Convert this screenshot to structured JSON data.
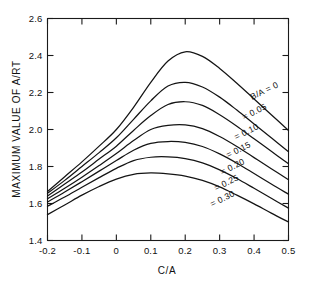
{
  "chart_data": {
    "type": "line",
    "title": "",
    "xlabel": "C/A",
    "ylabel": "MAXIMUM VALUE OF A/RT",
    "xlim": [
      -0.2,
      0.5
    ],
    "ylim": [
      1.4,
      2.6
    ],
    "xticks": [
      "-0.2",
      "-0.1",
      "0",
      "0.1",
      "0.2",
      "0.3",
      "0.4",
      "0.5"
    ],
    "xtick_values": [
      -0.2,
      -0.1,
      0,
      0.1,
      0.2,
      0.3,
      0.4,
      0.5
    ],
    "yticks": [
      "1.4",
      "1.6",
      "1.8",
      "2.0",
      "2.2",
      "2.4",
      "2.6"
    ],
    "ytick_values": [
      1.4,
      1.6,
      1.8,
      2.0,
      2.2,
      2.4,
      2.6
    ],
    "grid": false,
    "legend_position": "inline-right",
    "legend_prefix": "B/A =",
    "x": [
      -0.2,
      -0.15,
      -0.1,
      -0.05,
      0.0,
      0.05,
      0.1,
      0.15,
      0.2,
      0.25,
      0.3,
      0.35,
      0.4,
      0.45,
      0.5
    ],
    "series": [
      {
        "name": "B/A = 0",
        "label": "B/A = 0",
        "values": [
          1.665,
          1.745,
          1.825,
          1.91,
          2.0,
          2.12,
          2.255,
          2.37,
          2.42,
          2.395,
          2.33,
          2.25,
          2.165,
          2.08,
          1.995
        ]
      },
      {
        "name": "B/A = 0.05",
        "label": "= 0.05",
        "values": [
          1.655,
          1.725,
          1.8,
          1.875,
          1.955,
          2.055,
          2.155,
          2.235,
          2.255,
          2.23,
          2.175,
          2.105,
          2.03,
          1.955,
          1.88
        ]
      },
      {
        "name": "B/A = 0.10",
        "label": "= 0.10",
        "values": [
          1.64,
          1.705,
          1.77,
          1.84,
          1.91,
          1.995,
          2.075,
          2.135,
          2.15,
          2.13,
          2.08,
          2.018,
          1.95,
          1.882,
          1.815
        ]
      },
      {
        "name": "B/A = 0.15",
        "label": "= 0.15",
        "values": [
          1.625,
          1.682,
          1.742,
          1.805,
          1.87,
          1.94,
          2.0,
          2.022,
          2.025,
          2.005,
          1.962,
          1.908,
          1.848,
          1.788,
          1.728
        ]
      },
      {
        "name": "B/A = 0.20",
        "label": "= 0.20",
        "values": [
          1.608,
          1.662,
          1.718,
          1.775,
          1.832,
          1.888,
          1.925,
          1.935,
          1.93,
          1.908,
          1.868,
          1.818,
          1.762,
          1.705,
          1.65
        ]
      },
      {
        "name": "B/A = 0.25",
        "label": "= 0.25",
        "values": [
          1.585,
          1.635,
          1.688,
          1.74,
          1.79,
          1.832,
          1.85,
          1.852,
          1.843,
          1.82,
          1.782,
          1.735,
          1.682,
          1.628,
          1.575
        ]
      },
      {
        "name": "B/A = 0.30",
        "label": "= 0.30",
        "values": [
          1.54,
          1.592,
          1.645,
          1.692,
          1.732,
          1.758,
          1.765,
          1.76,
          1.748,
          1.725,
          1.69,
          1.645,
          1.598,
          1.548,
          1.5
        ]
      }
    ],
    "series_label_positions": [
      {
        "x": 252,
        "y": 100,
        "rotate": -26
      },
      {
        "x": 244,
        "y": 120,
        "rotate": -26
      },
      {
        "x": 236,
        "y": 140,
        "rotate": -26
      },
      {
        "x": 228,
        "y": 158,
        "rotate": -26
      },
      {
        "x": 222,
        "y": 175,
        "rotate": -26
      },
      {
        "x": 216,
        "y": 191,
        "rotate": -26
      },
      {
        "x": 212,
        "y": 207,
        "rotate": -26
      }
    ]
  }
}
